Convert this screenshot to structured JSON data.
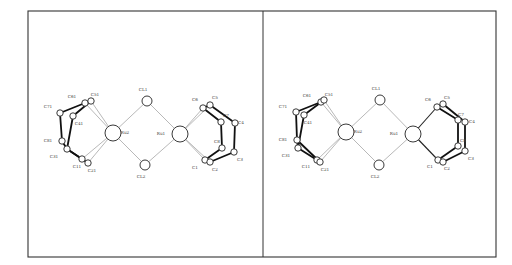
{
  "figure": {
    "type": "stereo-pair ORTEP molecular structure",
    "frame": {
      "x": 28,
      "y": 11,
      "w": 468,
      "h": 246,
      "divider_x": 263
    },
    "colors": {
      "line": "#333333",
      "thin_bond": "#9a9a9a",
      "thick_bond": "#111111",
      "atom_fill": "#ffffff"
    }
  },
  "panels": [
    {
      "name": "left-view",
      "atoms": [
        {
          "id": "Ru2",
          "label": "Ru2",
          "x": 113,
          "y": 133,
          "r": 8,
          "lx": 125,
          "ly": 134
        },
        {
          "id": "Ru1",
          "label": "Ru1",
          "x": 180,
          "y": 134,
          "r": 8,
          "lx": 161,
          "ly": 135
        },
        {
          "id": "CL1",
          "label": "CL1",
          "x": 147,
          "y": 101,
          "r": 5,
          "lx": 143,
          "ly": 91
        },
        {
          "id": "CL2",
          "label": "CL2",
          "x": 145,
          "y": 165,
          "r": 5,
          "lx": 141,
          "ly": 178
        },
        {
          "id": "C71",
          "label": "C71",
          "x": 60,
          "y": 113,
          "r": 3.2,
          "lx": 48,
          "ly": 108
        },
        {
          "id": "C61",
          "label": "C61",
          "x": 85,
          "y": 103,
          "r": 3.2,
          "lx": 72,
          "ly": 98
        },
        {
          "id": "C51",
          "label": "C51",
          "x": 91,
          "y": 101,
          "r": 3.2,
          "lx": 95,
          "ly": 96
        },
        {
          "id": "C41",
          "label": "C41",
          "x": 73,
          "y": 116,
          "r": 3.2,
          "lx": 79,
          "ly": 125
        },
        {
          "id": "C81",
          "label": "C81",
          "x": 62,
          "y": 141,
          "r": 3.2,
          "lx": 48,
          "ly": 142
        },
        {
          "id": "C31",
          "label": "C31",
          "x": 67,
          "y": 149,
          "r": 3.2,
          "lx": 54,
          "ly": 158
        },
        {
          "id": "C11",
          "label": "C11",
          "x": 82,
          "y": 159,
          "r": 3.2,
          "lx": 77,
          "ly": 168
        },
        {
          "id": "C21",
          "label": "C21",
          "x": 88,
          "y": 163,
          "r": 3.2,
          "lx": 92,
          "ly": 172
        },
        {
          "id": "C6",
          "label": "C6",
          "x": 203,
          "y": 108,
          "r": 3.2,
          "lx": 195,
          "ly": 101
        },
        {
          "id": "C5",
          "label": "C5",
          "x": 210,
          "y": 105,
          "r": 3.2,
          "lx": 215,
          "ly": 99
        },
        {
          "id": "C7",
          "label": "C7",
          "x": 221,
          "y": 122,
          "r": 3.2,
          "lx": 226,
          "ly": 117
        },
        {
          "id": "C4",
          "label": "C4",
          "x": 235,
          "y": 123,
          "r": 3.2,
          "lx": 241,
          "ly": 124
        },
        {
          "id": "C8",
          "label": "C8",
          "x": 222,
          "y": 148,
          "r": 3.2,
          "lx": 217,
          "ly": 143
        },
        {
          "id": "C3",
          "label": "C3",
          "x": 234,
          "y": 152,
          "r": 3.2,
          "lx": 240,
          "ly": 161
        },
        {
          "id": "C1",
          "label": "C1",
          "x": 205,
          "y": 160,
          "r": 3.2,
          "lx": 195,
          "ly": 169
        },
        {
          "id": "C2",
          "label": "C2",
          "x": 210,
          "y": 162,
          "r": 3.2,
          "lx": 215,
          "ly": 171
        }
      ],
      "bonds": [
        [
          "Ru2",
          "CL1",
          "thin"
        ],
        [
          "Ru2",
          "CL2",
          "thin"
        ],
        [
          "Ru1",
          "CL1",
          "thin"
        ],
        [
          "Ru1",
          "CL2",
          "thin"
        ],
        [
          "Ru2",
          "C51",
          "thin"
        ],
        [
          "Ru2",
          "C61",
          "thin"
        ],
        [
          "Ru2",
          "C11",
          "thin"
        ],
        [
          "Ru2",
          "C21",
          "thin"
        ],
        [
          "Ru1",
          "C6",
          "thin"
        ],
        [
          "Ru1",
          "C5",
          "thin"
        ],
        [
          "Ru1",
          "C1",
          "thin"
        ],
        [
          "Ru1",
          "C2",
          "thin"
        ],
        [
          "C71",
          "C61",
          "thick"
        ],
        [
          "C61",
          "C51",
          "thick"
        ],
        [
          "C51",
          "C41",
          "thick"
        ],
        [
          "C71",
          "C81",
          "thick"
        ],
        [
          "C81",
          "C31",
          "thick"
        ],
        [
          "C41",
          "C31",
          "thick"
        ],
        [
          "C31",
          "C11",
          "thick"
        ],
        [
          "C11",
          "C21",
          "thick"
        ],
        [
          "C31",
          "C21",
          "thick"
        ],
        [
          "C6",
          "C5",
          "thick"
        ],
        [
          "C5",
          "C4",
          "thick"
        ],
        [
          "C6",
          "C7",
          "thick"
        ],
        [
          "C7",
          "C8",
          "thick"
        ],
        [
          "C4",
          "C3",
          "thick"
        ],
        [
          "C8",
          "C1",
          "thick"
        ],
        [
          "C3",
          "C2",
          "thick"
        ],
        [
          "C1",
          "C2",
          "thick"
        ]
      ]
    },
    {
      "name": "right-view",
      "atoms": [
        {
          "id": "Ru2",
          "label": "Ru2",
          "x": 346,
          "y": 132,
          "r": 8,
          "lx": 358,
          "ly": 133
        },
        {
          "id": "Ru1",
          "label": "Ru1",
          "x": 413,
          "y": 134,
          "r": 8,
          "lx": 394,
          "ly": 135
        },
        {
          "id": "CL1",
          "label": "CL1",
          "x": 380,
          "y": 100,
          "r": 5,
          "lx": 376,
          "ly": 90
        },
        {
          "id": "CL2",
          "label": "CL2",
          "x": 379,
          "y": 165,
          "r": 5,
          "lx": 375,
          "ly": 178
        },
        {
          "id": "C71",
          "label": "C71",
          "x": 296,
          "y": 112,
          "r": 3.2,
          "lx": 283,
          "ly": 108
        },
        {
          "id": "C61",
          "label": "C61",
          "x": 321,
          "y": 102,
          "r": 3.2,
          "lx": 307,
          "ly": 97
        },
        {
          "id": "C51",
          "label": "C51",
          "x": 324,
          "y": 100,
          "r": 3.2,
          "lx": 329,
          "ly": 96
        },
        {
          "id": "C41",
          "label": "C41",
          "x": 304,
          "y": 115,
          "r": 3.2,
          "lx": 308,
          "ly": 124
        },
        {
          "id": "C81",
          "label": "C81",
          "x": 297,
          "y": 140,
          "r": 3.2,
          "lx": 283,
          "ly": 141
        },
        {
          "id": "C31",
          "label": "C31",
          "x": 298,
          "y": 148,
          "r": 3.2,
          "lx": 286,
          "ly": 157
        },
        {
          "id": "C11",
          "label": "C11",
          "x": 317,
          "y": 160,
          "r": 3.2,
          "lx": 306,
          "ly": 168
        },
        {
          "id": "C21",
          "label": "C21",
          "x": 320,
          "y": 162,
          "r": 3.2,
          "lx": 325,
          "ly": 171
        },
        {
          "id": "C6",
          "label": "C6",
          "x": 437,
          "y": 107,
          "r": 3.2,
          "lx": 428,
          "ly": 101
        },
        {
          "id": "C5",
          "label": "C5",
          "x": 443,
          "y": 104,
          "r": 3.2,
          "lx": 447,
          "ly": 99
        },
        {
          "id": "C7",
          "label": "C7",
          "x": 458,
          "y": 120,
          "r": 3.2,
          "lx": 461,
          "ly": 116
        },
        {
          "id": "C4",
          "label": "C4",
          "x": 465,
          "y": 122,
          "r": 3.2,
          "lx": 472,
          "ly": 123
        },
        {
          "id": "C8",
          "label": "C8",
          "x": 458,
          "y": 146,
          "r": 3.2,
          "lx": 463,
          "ly": 142
        },
        {
          "id": "C3",
          "label": "C3",
          "x": 465,
          "y": 151,
          "r": 3.2,
          "lx": 471,
          "ly": 160
        },
        {
          "id": "C1",
          "label": "C1",
          "x": 438,
          "y": 160,
          "r": 3.2,
          "lx": 430,
          "ly": 168
        },
        {
          "id": "C2",
          "label": "C2",
          "x": 443,
          "y": 162,
          "r": 3.2,
          "lx": 447,
          "ly": 170
        }
      ],
      "bonds": [
        [
          "Ru2",
          "CL1",
          "thin"
        ],
        [
          "Ru2",
          "CL2",
          "thin"
        ],
        [
          "Ru1",
          "CL1",
          "thin"
        ],
        [
          "Ru1",
          "CL2",
          "thin"
        ],
        [
          "Ru2",
          "C51",
          "thin"
        ],
        [
          "Ru2",
          "C61",
          "thin"
        ],
        [
          "Ru2",
          "C11",
          "thin"
        ],
        [
          "Ru2",
          "C21",
          "thin"
        ],
        [
          "Ru1",
          "C6",
          "mid"
        ],
        [
          "Ru1",
          "C1",
          "mid"
        ],
        [
          "C71",
          "C61",
          "thick"
        ],
        [
          "C61",
          "C51",
          "thick"
        ],
        [
          "C51",
          "C41",
          "thick"
        ],
        [
          "C71",
          "C81",
          "thick"
        ],
        [
          "C81",
          "C31",
          "thick"
        ],
        [
          "C41",
          "C31",
          "thick"
        ],
        [
          "C31",
          "C11",
          "thick"
        ],
        [
          "C11",
          "C21",
          "thick"
        ],
        [
          "C81",
          "C21",
          "thick"
        ],
        [
          "C6",
          "C5",
          "thick"
        ],
        [
          "C5",
          "C4",
          "thick"
        ],
        [
          "C6",
          "C7",
          "thick"
        ],
        [
          "C7",
          "C8",
          "thick"
        ],
        [
          "C4",
          "C3",
          "thick"
        ],
        [
          "C8",
          "C1",
          "thick"
        ],
        [
          "C3",
          "C2",
          "thick"
        ],
        [
          "C1",
          "C2",
          "thick"
        ]
      ]
    }
  ]
}
